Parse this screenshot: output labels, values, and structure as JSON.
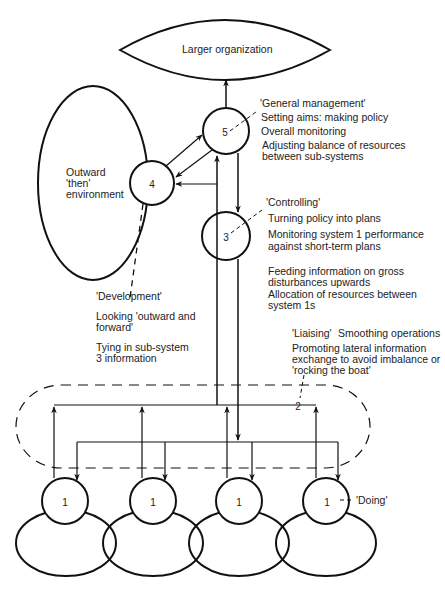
{
  "diagram": {
    "larger_organization": "Larger organization",
    "environment": [
      "Outward",
      "'then'",
      "environment"
    ],
    "system5": {
      "number": "5",
      "heading": "'General management'",
      "lines": [
        "Setting aims: making policy",
        "Overall monitoring",
        "Adjusting balance of resources",
        "between sub-systems"
      ]
    },
    "system4": {
      "number": "4",
      "heading": "'Development'",
      "lines": [
        "Looking 'outward and",
        "forward'",
        "Tying in sub-system",
        "3 information"
      ]
    },
    "system3": {
      "number": "3",
      "heading": "'Controlling'",
      "lines": [
        "Turning policy into plans",
        "Monitoring system 1 performance",
        "against short-term plans",
        "Feeding information on gross",
        "disturbances upwards",
        "Allocation of resources between",
        "system 1s"
      ]
    },
    "system2": {
      "number": "2",
      "heading": "'Liaising'",
      "subheading": "Smoothing operations",
      "lines": [
        "Promoting lateral information",
        "exchange to avoid imbalance or",
        "'rocking the boat'"
      ]
    },
    "system1": {
      "numbers": [
        "1",
        "1",
        "1",
        "1"
      ],
      "heading": "'Doing'"
    },
    "colors": {
      "stroke": "#111111",
      "background": "#ffffff"
    }
  }
}
